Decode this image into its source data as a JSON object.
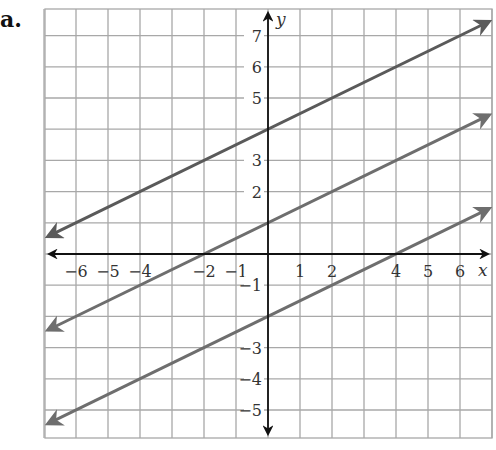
{
  "problem_label": "a.",
  "chart_data": {
    "type": "line",
    "title": "",
    "xlabel": "x",
    "ylabel": "y",
    "xlim": [
      -7,
      7
    ],
    "ylim": [
      -6,
      8
    ],
    "grid": true,
    "x_tick_labels": [
      "−6",
      "−5",
      "−4",
      "−2",
      "−1",
      "1",
      "2",
      "4",
      "5",
      "6"
    ],
    "x_ticks": [
      -6,
      -5,
      -4,
      -2,
      -1,
      1,
      2,
      4,
      5,
      6
    ],
    "y_tick_labels": [
      "7",
      "6",
      "5",
      "3",
      "2",
      "−1",
      "−3",
      "−4",
      "−5"
    ],
    "y_ticks": [
      7,
      6,
      5,
      3,
      2,
      -1,
      -3,
      -4,
      -5
    ],
    "series": [
      {
        "name": "y = 1/2 x + 4",
        "slope": 0.5,
        "intercept": 4,
        "x": [
          -7,
          7
        ],
        "y": [
          0.5,
          7.5
        ],
        "color": "#5a5a5a"
      },
      {
        "name": "y = 1/2 x + 1",
        "slope": 0.5,
        "intercept": 1,
        "x": [
          -7,
          7
        ],
        "y": [
          -2.5,
          4.5
        ],
        "color": "#6e6e6e"
      },
      {
        "name": "y = 1/2 x - 2",
        "slope": 0.5,
        "intercept": -2,
        "x": [
          -7,
          7
        ],
        "y": [
          -5.5,
          1.5
        ],
        "color": "#6e6e6e"
      }
    ],
    "colors": {
      "grid": "#a8a8a8",
      "axis": "#111111"
    }
  }
}
